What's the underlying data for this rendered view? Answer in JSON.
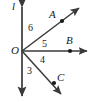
{
  "figure": {
    "stroke_color": "#3a3a3a",
    "text_color": "#1a1a1a",
    "background_color": "#ffffff",
    "vertex": {
      "name": "O",
      "label": "O",
      "x": 22,
      "y": 51
    },
    "line": {
      "name": "l",
      "label": "l",
      "type": "line",
      "x1": 22,
      "y1": 5,
      "x2": 22,
      "y2": 98,
      "arrow_start": true,
      "arrow_end": true
    },
    "rays": [
      {
        "name": "OA",
        "label": "A",
        "from_x": 22,
        "from_y": 51,
        "to_x": 81,
        "to_y": 6,
        "point_x": 62,
        "point_y": 21,
        "arrow_end": true
      },
      {
        "name": "OB",
        "label": "B",
        "from_x": 22,
        "from_y": 51,
        "to_x": 89,
        "to_y": 51,
        "point_x": 70,
        "point_y": 51,
        "arrow_end": true
      },
      {
        "name": "OC",
        "label": "C",
        "from_x": 22,
        "from_y": 51,
        "to_x": 63,
        "to_y": 96,
        "point_x": 54,
        "point_y": 83,
        "arrow_end": true
      }
    ],
    "angle_labels": [
      {
        "name": "angle-6",
        "label": "6",
        "x": 28,
        "y": 23
      },
      {
        "name": "angle-5",
        "label": "5",
        "x": 42,
        "y": 39
      },
      {
        "name": "angle-4",
        "label": "4",
        "x": 40,
        "y": 55
      },
      {
        "name": "angle-3",
        "label": "3",
        "x": 27,
        "y": 66
      }
    ]
  }
}
